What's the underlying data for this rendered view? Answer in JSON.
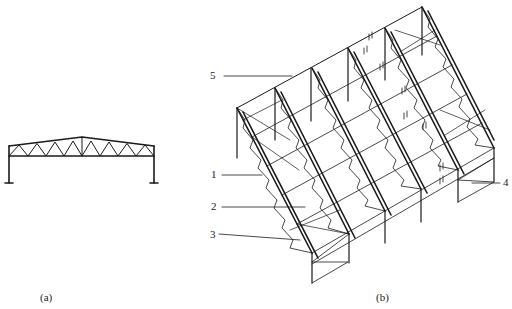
{
  "figure": {
    "panel_a": {
      "caption": "(a)",
      "description": "Elevation of steel truss portal frame with gable roof"
    },
    "panel_b": {
      "caption": "(b)",
      "description": "Isometric view of multi-bay truss frame structure with bracing",
      "labels": [
        {
          "id": "1",
          "text": "1"
        },
        {
          "id": "2",
          "text": "2"
        },
        {
          "id": "3",
          "text": "3"
        },
        {
          "id": "4",
          "text": "4"
        },
        {
          "id": "5",
          "text": "5"
        }
      ]
    },
    "colors": {
      "line": "#1a1a1a",
      "background": "#ffffff"
    }
  }
}
